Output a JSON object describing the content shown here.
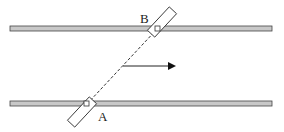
{
  "diagram": {
    "labels": {
      "a": "A",
      "b": "B"
    },
    "colors": {
      "rail_fill": "#c8c8c8",
      "stroke": "#333333",
      "background": "#ffffff"
    },
    "elements": [
      "top-rail",
      "bottom-rail",
      "rod-AB (dashed)",
      "block-A",
      "block-B",
      "velocity-arrow"
    ]
  }
}
